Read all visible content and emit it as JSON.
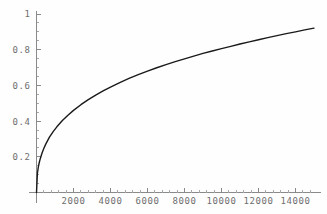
{
  "chart_data": {
    "type": "line",
    "title": "",
    "subtitle": "",
    "xlabel": "",
    "ylabel": "",
    "xlim": [
      0,
      15400
    ],
    "ylim": [
      0,
      1.04
    ],
    "grid": false,
    "legend": null,
    "x_ticks": [
      2000,
      4000,
      6000,
      8000,
      10000,
      12000,
      14000
    ],
    "x_tick_labels": [
      "2000",
      "4000",
      "6000",
      "8000",
      "10000",
      "12000",
      "14000"
    ],
    "x_minor_ticks": [
      400,
      800,
      1200,
      1600,
      2400,
      2800,
      3200,
      3600,
      4400,
      4800,
      5200,
      5600,
      6400,
      6800,
      7200,
      7600,
      8400,
      8800,
      9200,
      9600,
      10400,
      10800,
      11200,
      11600,
      12400,
      12800,
      13200,
      13600,
      14400,
      14800
    ],
    "y_ticks": [
      0.2,
      0.4,
      0.6,
      0.8,
      1
    ],
    "y_tick_labels": [
      "0.2",
      "0.4",
      "0.6",
      "0.8",
      "1"
    ],
    "y_minor_ticks": [
      0.05,
      0.1,
      0.15,
      0.25,
      0.3,
      0.35,
      0.45,
      0.5,
      0.55,
      0.65,
      0.7,
      0.75,
      0.85,
      0.9,
      0.95
    ],
    "series": [
      {
        "name": "curve",
        "color": "#1a1a1a",
        "x": [
          0,
          50,
          100,
          150,
          200,
          300,
          400,
          500,
          700,
          900,
          1100,
          1400,
          1700,
          2000,
          2400,
          2800,
          3200,
          3600,
          4000,
          4500,
          5000,
          5500,
          6000,
          6500,
          7000,
          7500,
          8000,
          8500,
          9000,
          9500,
          10000,
          10500,
          11000,
          11500,
          12000,
          12500,
          13000,
          13500,
          14000,
          14500,
          15000
        ],
        "y": [
          0.0,
          0.108,
          0.143,
          0.168,
          0.188,
          0.221,
          0.248,
          0.271,
          0.31,
          0.341,
          0.368,
          0.403,
          0.433,
          0.46,
          0.492,
          0.52,
          0.546,
          0.569,
          0.591,
          0.616,
          0.639,
          0.66,
          0.68,
          0.699,
          0.716,
          0.733,
          0.749,
          0.764,
          0.779,
          0.793,
          0.806,
          0.819,
          0.832,
          0.844,
          0.856,
          0.868,
          0.879,
          0.89,
          0.9,
          0.911,
          0.921
        ]
      }
    ],
    "colors": {
      "background": "#fefefe",
      "curve": "#1a1a1a",
      "axis": "#8a8a8a",
      "tick_label": "#6e6e6e"
    }
  }
}
